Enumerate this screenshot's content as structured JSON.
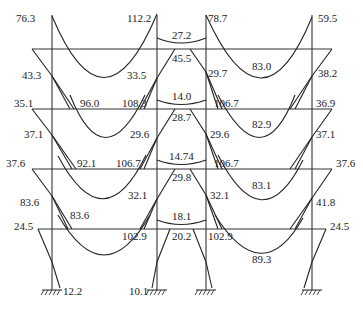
{
  "diagram": {
    "type": "frame-bending-moment-diagram",
    "units": "kN·m",
    "stories": 4,
    "bays": [
      "outer-left",
      "middle",
      "outer-right"
    ],
    "roof": {
      "left_beam": {
        "left_end": "76.3",
        "right_end": "112.2",
        "midspan": "33.5"
      },
      "middle_beam": {
        "midspan": "27.2"
      },
      "right_beam": {
        "left_end": "78.7",
        "right_end": "59.5",
        "midspan": "83.0"
      },
      "columns": {
        "left": "43.3",
        "inner_left": "45.5",
        "inner_right": "29.7",
        "right": "38.2"
      }
    },
    "floor3": {
      "left_beam": {
        "left_end": "35.1",
        "right_end": "108.3",
        "midspan": "96.0"
      },
      "middle_beam": {
        "midspan": "14.0"
      },
      "right_beam": {
        "left_end": "106.7",
        "right_end": "36.9",
        "midspan": "82.9"
      },
      "columns": {
        "left": "37.1",
        "inner_left": "29.6",
        "inner_mid": "28.7",
        "inner_right": "29.6",
        "right": "37.1"
      }
    },
    "floor2": {
      "left_beam": {
        "left_end": "37.6",
        "right_end": "106.7",
        "midspan": "92.1"
      },
      "middle_beam": {
        "midspan": "14.74"
      },
      "right_beam": {
        "left_end": "106.7",
        "right_end": "37.6",
        "midspan": "83.1"
      },
      "columns": {
        "left": "83.6",
        "left_beam_end": "83.6",
        "inner_left": "32.1",
        "inner_mid": "29.8",
        "inner_right": "32.1",
        "right": "41.8"
      }
    },
    "floor1": {
      "left_beam": {
        "left_end": "24.5",
        "right_end": "102.9"
      },
      "middle_beam": {
        "midspan": "18.1",
        "column_label": "20.2"
      },
      "right_beam": {
        "left_end": "102.9",
        "right_end": "24.5",
        "midspan": "89.3"
      }
    },
    "base": {
      "left": "12.2",
      "inner_left": "10.1"
    }
  }
}
